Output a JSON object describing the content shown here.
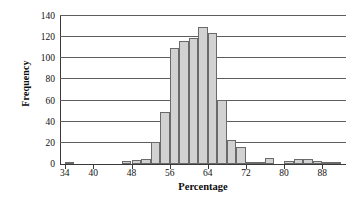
{
  "chart_data": {
    "type": "bar",
    "title": "",
    "subtitle": "",
    "xlabel": "Percentage",
    "ylabel": "Frequency",
    "xlim": [
      33,
      93
    ],
    "ylim": [
      0,
      140
    ],
    "bin_width": 2,
    "grid": true,
    "legend": null,
    "bar_fill_color": "#d2d2d2",
    "bar_edge_color": "#6a6a6a",
    "axis_color": "#3a3a3a",
    "gridline_color": "#5d5d5d",
    "background_color": "#ffffff",
    "ytick_labels": [
      "0",
      "20",
      "40",
      "60",
      "80",
      "100",
      "120",
      "140"
    ],
    "ytick_values": [
      0,
      20,
      40,
      60,
      80,
      100,
      120,
      140
    ],
    "xtick_labels": [
      "34",
      "40",
      "48",
      "56",
      "64",
      "72",
      "80",
      "88"
    ],
    "xtick_values": [
      34,
      40,
      48,
      56,
      64,
      72,
      80,
      88
    ],
    "categories": [
      "34-36",
      "36-38",
      "38-40",
      "40-42",
      "42-44",
      "44-46",
      "46-48",
      "48-50",
      "50-52",
      "52-54",
      "54-56",
      "56-58",
      "58-60",
      "60-62",
      "62-64",
      "64-66",
      "66-68",
      "68-70",
      "70-72",
      "72-74",
      "74-76",
      "76-78",
      "78-80",
      "80-82",
      "82-84",
      "84-86",
      "86-88",
      "88-90",
      "90-92"
    ],
    "bin_starts": [
      34,
      36,
      38,
      40,
      42,
      44,
      46,
      48,
      50,
      52,
      54,
      56,
      58,
      60,
      62,
      64,
      66,
      68,
      70,
      72,
      74,
      76,
      78,
      80,
      82,
      84,
      86,
      88,
      90
    ],
    "values": [
      2,
      0,
      0,
      0,
      0,
      0,
      3,
      4,
      5,
      21,
      49,
      110,
      116,
      119,
      130,
      124,
      61,
      23,
      16,
      2,
      2,
      6,
      0,
      3,
      5,
      5,
      3,
      1,
      1
    ]
  },
  "axes": {
    "y_title": "Frequency",
    "x_title": "Percentage"
  }
}
